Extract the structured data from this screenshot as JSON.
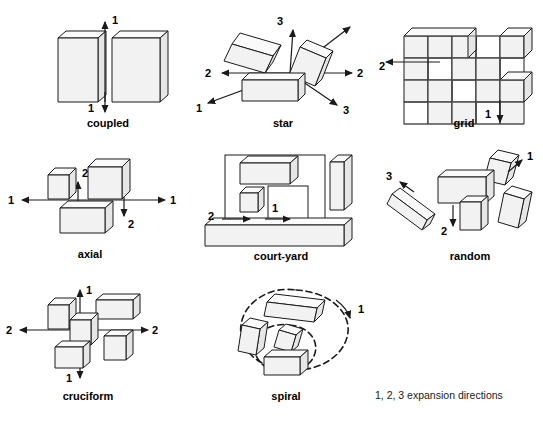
{
  "figure": {
    "caption": "1, 2, 3 expansion directions",
    "colors": {
      "block_front": "#f2f2f2",
      "block_top": "#fafafa",
      "block_side": "#e6e6e6",
      "outline": "#1a1a1a",
      "background": "#ffffff"
    }
  },
  "patterns": [
    {
      "id": "coupled",
      "label": "coupled",
      "directions": [
        "1",
        "1"
      ],
      "direction_count": 1
    },
    {
      "id": "star",
      "label": "star",
      "directions": [
        "3",
        "2",
        "2",
        "1",
        "3"
      ],
      "direction_count": 3
    },
    {
      "id": "grid",
      "label": "grid",
      "directions": [
        "2",
        "1"
      ],
      "direction_count": 2
    },
    {
      "id": "axial",
      "label": "axial",
      "directions": [
        "1",
        "2",
        "1",
        "2"
      ],
      "direction_count": 2
    },
    {
      "id": "court-yard",
      "label": "court-yard",
      "directions": [
        "2",
        "1"
      ],
      "direction_count": 2
    },
    {
      "id": "random",
      "label": "random",
      "directions": [
        "1",
        "3",
        "2"
      ],
      "direction_count": 3
    },
    {
      "id": "cruciform",
      "label": "cruciform",
      "directions": [
        "1",
        "2",
        "2",
        "1"
      ],
      "direction_count": 2
    },
    {
      "id": "spiral",
      "label": "spiral",
      "directions": [
        "1"
      ],
      "direction_count": 1
    }
  ],
  "labels": {
    "coupled": "coupled",
    "star": "star",
    "grid": "grid",
    "axial": "axial",
    "courtyard": "court-yard",
    "random": "random",
    "cruciform": "cruciform",
    "spiral": "spiral"
  },
  "marks": {
    "one": "1",
    "two": "2",
    "three": "3"
  }
}
